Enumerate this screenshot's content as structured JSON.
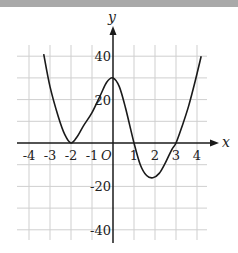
{
  "chart_data": {
    "type": "line",
    "title": "",
    "xlabel": "x",
    "ylabel": "y",
    "origin_label": "O",
    "xlim": [
      -4.5,
      4.5
    ],
    "ylim": [
      -45,
      45
    ],
    "grid": true,
    "x_ticks": [
      -4,
      -3,
      -2,
      -1,
      1,
      2,
      3,
      4
    ],
    "x_tick_labels": [
      "-4",
      "-3",
      "-2",
      "-1",
      "1",
      "2",
      "3",
      "4"
    ],
    "y_ticks": [
      40,
      20,
      -20,
      -40
    ],
    "y_tick_labels": [
      "40",
      "20",
      "-20",
      "-40"
    ],
    "series": [
      {
        "name": "f(x)",
        "x": [
          -3.3,
          -3.0,
          -2.6,
          -2.3,
          -2.0,
          -1.7,
          -1.4,
          -1.0,
          -0.6,
          -0.3,
          0.0,
          0.3,
          0.6,
          1.0,
          1.3,
          1.6,
          1.9,
          2.2,
          2.5,
          2.8,
          3.0,
          3.3,
          3.6,
          3.9,
          4.2
        ],
        "y": [
          41,
          26,
          12,
          4,
          0,
          3,
          8,
          14,
          22,
          28,
          30,
          26,
          16,
          0,
          -10,
          -15,
          -16,
          -14,
          -9,
          -3,
          0,
          8,
          17,
          28,
          40
        ]
      }
    ]
  }
}
